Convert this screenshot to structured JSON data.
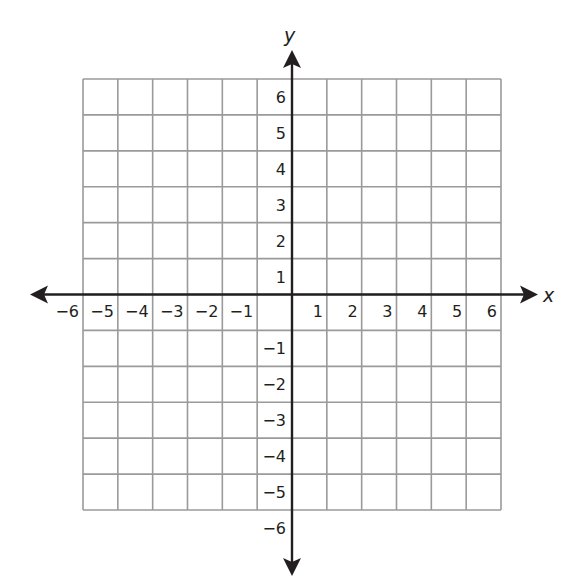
{
  "diagram": {
    "type": "coordinate-plane",
    "x_axis": {
      "label": "x",
      "min": -6,
      "max": 6,
      "step": 1,
      "tick_labels": [
        "−6",
        "−5",
        "−4",
        "−3",
        "−2",
        "−1",
        "1",
        "2",
        "3",
        "4",
        "5",
        "6"
      ]
    },
    "y_axis": {
      "label": "y",
      "min": -6,
      "max": 6,
      "step": 1,
      "tick_labels": [
        "6",
        "5",
        "4",
        "3",
        "2",
        "1",
        "−1",
        "−2",
        "−3",
        "−4",
        "−5",
        "−6"
      ]
    },
    "grid": {
      "columns": 12,
      "rows": 12,
      "visible": true
    },
    "colors": {
      "grid": "#9a9a9a",
      "axis": "#231f20",
      "text": "#231f20",
      "background": "#ffffff"
    }
  }
}
